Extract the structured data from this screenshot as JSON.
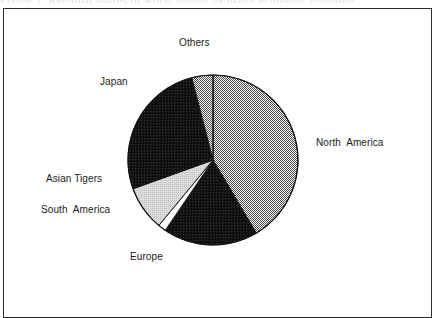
{
  "figure": {
    "caption_remnant": "Figure 1.  Regional shares of world output by major economic grouping"
  },
  "chart_data": {
    "type": "pie",
    "title": "",
    "subtitle": "",
    "xlabel": "",
    "ylabel": "",
    "grid": false,
    "legend_position": "none",
    "labels_position": "outside-with-leaders",
    "start_angle_deg": 0,
    "direction": "clockwise",
    "categories": [
      "North  America",
      "Europe",
      "South  America",
      "Asian Tigers",
      "Japan",
      "Others"
    ],
    "values": [
      41.5,
      18.0,
      1.5,
      8.5,
      26.5,
      4.0
    ],
    "units": "percent",
    "slices": [
      {
        "label": "North  America",
        "value": 41.5,
        "start_deg": 0,
        "end_deg": 149.4,
        "fill": "#b3b3b3",
        "pattern": "fine-dotted-gray",
        "label_x": 316,
        "label_y": 137,
        "label_anchor": "left"
      },
      {
        "label": "Europe",
        "value": 18.0,
        "start_deg": 149.4,
        "end_deg": 214.2,
        "fill": "#141414",
        "pattern": "solid-black",
        "label_x": 130,
        "label_y": 251,
        "label_anchor": "left"
      },
      {
        "label": "South  America",
        "value": 1.5,
        "start_deg": 214.2,
        "end_deg": 219.6,
        "fill": "#ffffff",
        "pattern": "white",
        "label_x": 41,
        "label_y": 204,
        "label_anchor": "left"
      },
      {
        "label": "Asian Tigers",
        "value": 8.5,
        "start_deg": 219.6,
        "end_deg": 250.2,
        "fill": "#d4d4d4",
        "pattern": "light-gray",
        "label_x": 46,
        "label_y": 173,
        "label_anchor": "left"
      },
      {
        "label": "Japan",
        "value": 26.5,
        "start_deg": 250.2,
        "end_deg": 345.6,
        "fill": "#141414",
        "pattern": "solid-black",
        "label_x": 100,
        "label_y": 76,
        "label_anchor": "left"
      },
      {
        "label": "Others",
        "value": 4.0,
        "start_deg": 345.6,
        "end_deg": 360,
        "fill": "#b3b3b3",
        "pattern": "fine-dotted-gray",
        "label_x": 179,
        "label_y": 37,
        "label_anchor": "center"
      }
    ],
    "geometry": {
      "center_x": 213,
      "center_y": 160,
      "radius": 85
    },
    "colors": {
      "outline": "#161616",
      "gray_dot": "#b3b3b3",
      "light_gray": "#d4d4d4",
      "black": "#141414",
      "white": "#ffffff",
      "frame": "#2b2b2b"
    }
  }
}
